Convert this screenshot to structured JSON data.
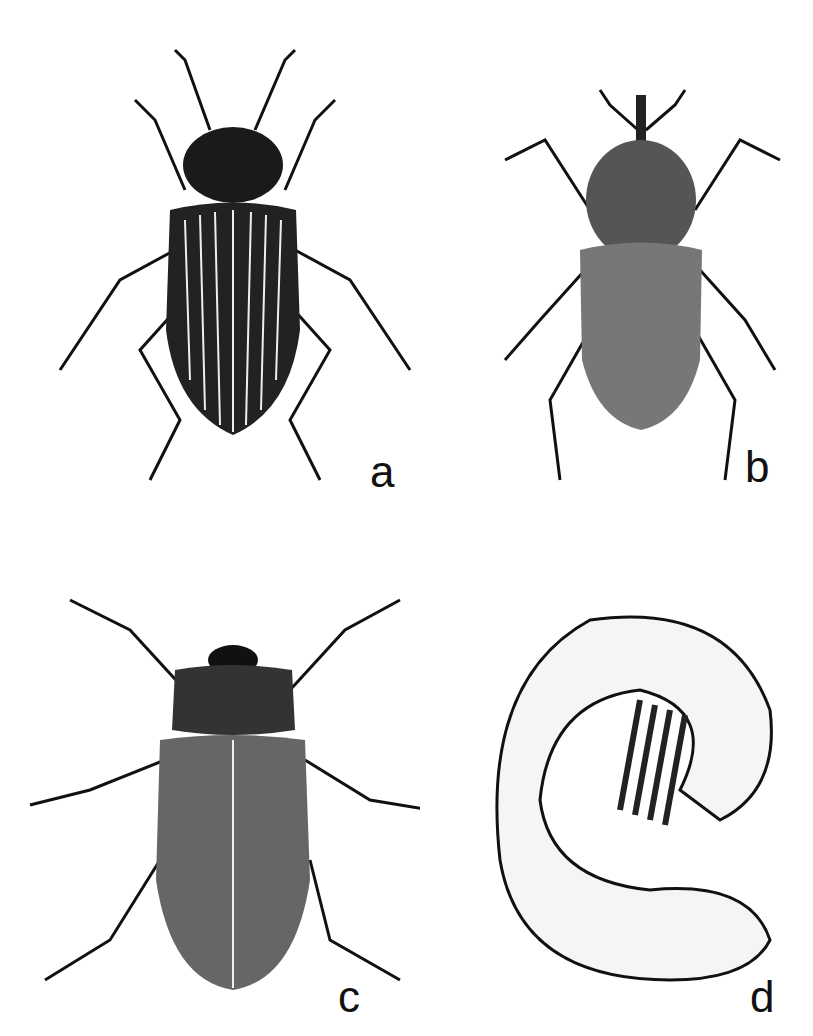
{
  "figure": {
    "panels": [
      {
        "label": "a",
        "subject": "darkling beetle (striated elytra)"
      },
      {
        "label": "b",
        "subject": "weevil"
      },
      {
        "label": "c",
        "subject": "scarab beetle (stippled)"
      },
      {
        "label": "d",
        "subject": "C-shaped grub larva"
      }
    ]
  }
}
